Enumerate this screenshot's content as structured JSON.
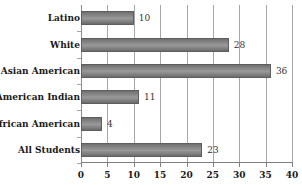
{
  "chart_data": {
    "type": "bar",
    "orientation": "horizontal",
    "title": "",
    "xlabel": "",
    "ylabel": "",
    "categories": [
      "All Students",
      "African American",
      "American Indian",
      "Asian American",
      "White",
      "Latino"
    ],
    "values": [
      23,
      4,
      11,
      36,
      28,
      10
    ],
    "xlim": [
      0,
      40
    ],
    "xticks": [
      0,
      5,
      10,
      15,
      20,
      25,
      30,
      35,
      40
    ],
    "xtick_labels": [
      "0",
      "5",
      "10",
      "15",
      "20",
      "25",
      "30",
      "35",
      "40"
    ],
    "grid": true,
    "grid_axis": "x",
    "legend": false,
    "data_labels": [
      "23",
      "4",
      "11",
      "36",
      "28",
      "10"
    ],
    "bar_color": "#8d8d8d",
    "bar_edge_color": "#5e5e5e",
    "gridline_color": "#a6a6a6",
    "axis_color": "#7f7f7f",
    "text_color": "#1a1a1a",
    "value_label_color": "#333333"
  }
}
